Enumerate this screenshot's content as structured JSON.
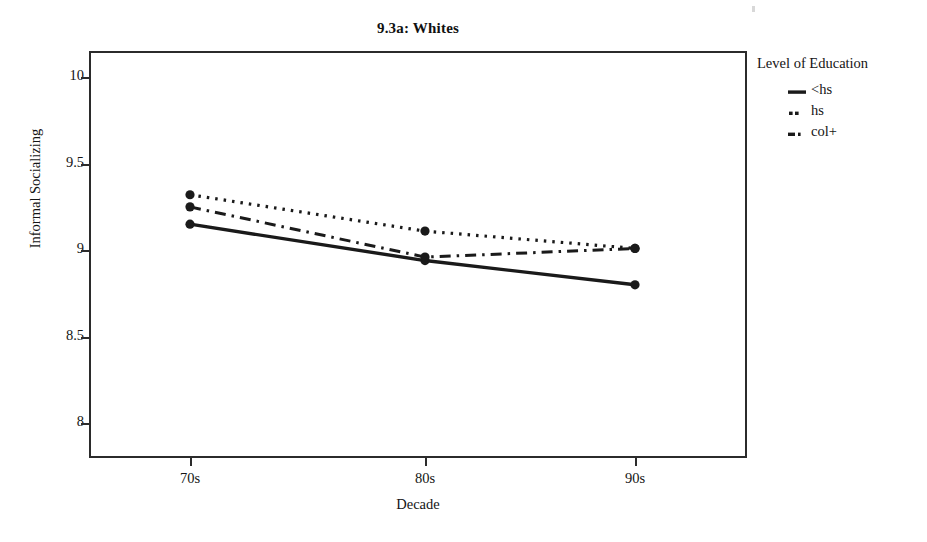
{
  "chart_data": {
    "type": "line",
    "title": "9.3a: Whites",
    "xlabel": "Decade",
    "ylabel": "Informal Socializing",
    "categories": [
      "70s",
      "80s",
      "90s"
    ],
    "x_tick_labels": [
      "70s",
      "80s",
      "90s"
    ],
    "y_tick_labels": [
      "8",
      "8.5",
      "9",
      "9.5",
      "10"
    ],
    "y_ticks": [
      8,
      8.5,
      9,
      9.5,
      10
    ],
    "ylim": [
      7.8,
      10.15
    ],
    "grid": false,
    "legend_position": "right",
    "legend_title": "Level of Education",
    "series": [
      {
        "name": "<hs",
        "style": "solid",
        "values": [
          9.15,
          8.94,
          8.8
        ],
        "markers": true
      },
      {
        "name": "hs",
        "style": "dotted",
        "values": [
          9.32,
          9.11,
          9.01
        ],
        "markers": true
      },
      {
        "name": "col+",
        "style": "dash-dot",
        "values": [
          9.25,
          8.96,
          9.01
        ],
        "markers": true
      }
    ],
    "colors": {
      "line": "#1a1a1a",
      "frame": "#2b2b2b",
      "background": "#ffffff"
    }
  },
  "legend": {
    "title": "Level of Education",
    "items": [
      {
        "label": "<hs",
        "swatch": "solid-line-icon"
      },
      {
        "label": "hs",
        "swatch": "dotted-line-icon"
      },
      {
        "label": "col+",
        "swatch": "dash-dot-line-icon"
      }
    ]
  }
}
